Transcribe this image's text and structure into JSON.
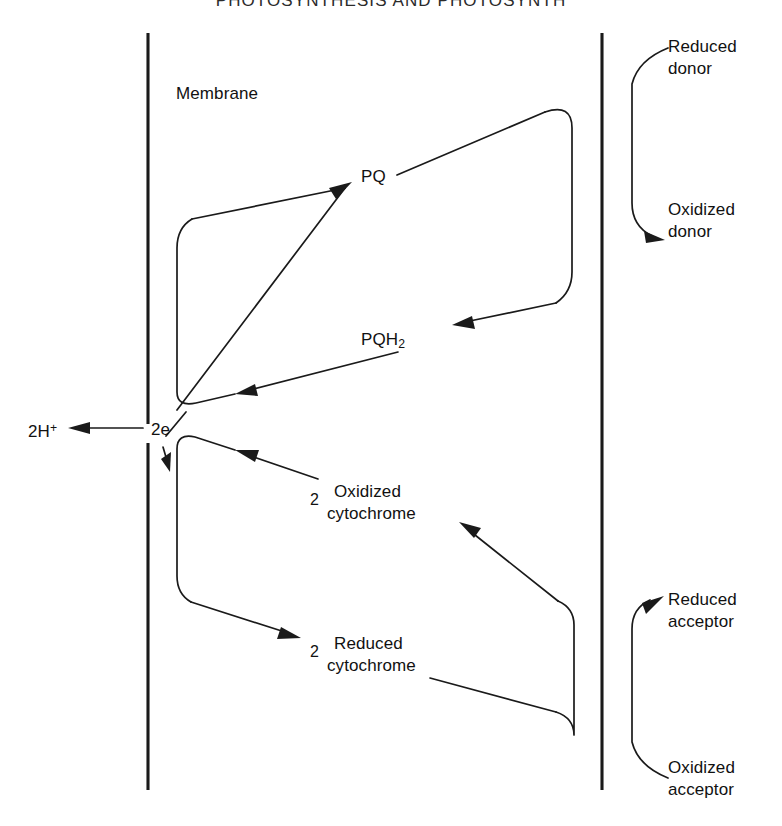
{
  "figure": {
    "title": "PHOTOSYNTHESIS AND PHOTOSYNTH",
    "membrane_label": "Membrane",
    "species": {
      "pq": "PQ",
      "pqh2_base": "PQH",
      "pqh2_sub": "2",
      "protons_base": "2H",
      "protons_sup": "+",
      "electrons": "2e",
      "stoich_oxidized_cyt": "2",
      "oxidized_cytochrome_line1": "Oxidized",
      "oxidized_cytochrome_line2": "cytochrome",
      "stoich_reduced_cyt": "2",
      "reduced_cytochrome_line1": "Reduced",
      "reduced_cytochrome_line2": "cytochrome"
    },
    "right_labels": {
      "reduced_donor_line1": "Reduced",
      "reduced_donor_line2": "donor",
      "oxidized_donor_line1": "Oxidized",
      "oxidized_donor_line2": "donor",
      "reduced_acceptor_line1": "Reduced",
      "reduced_acceptor_line2": "acceptor",
      "oxidized_acceptor_line1": "Oxidized",
      "oxidized_acceptor_line2": "acceptor"
    },
    "colors": {
      "ink": "#1a1a1a",
      "background": "#ffffff"
    }
  }
}
